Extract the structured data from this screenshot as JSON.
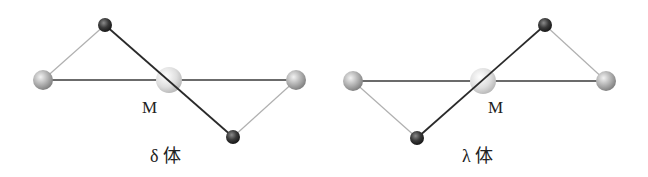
{
  "figure": {
    "panels": [
      {
        "id": "delta",
        "isomer_label": "δ 体",
        "metal_label": "M",
        "atoms": {
          "left": "ligand-donor",
          "top": "chelate-backbone",
          "center": "metal",
          "right": "ligand-donor",
          "bottom": "chelate-backbone"
        },
        "twist": "backbone goes top-left to bottom-right"
      },
      {
        "id": "lambda",
        "isomer_label": "λ 体",
        "metal_label": "M",
        "atoms": {
          "left": "ligand-donor",
          "bottom": "chelate-backbone",
          "center": "metal",
          "top": "chelate-backbone",
          "right": "ligand-donor"
        },
        "twist": "backbone goes bottom-left to top-right"
      }
    ],
    "colors": {
      "metal": "#d8d8d8",
      "donor": "#a8a8a8",
      "backbone": "#333333",
      "bond_dark": "#333333",
      "bond_light": "#a0a0a0"
    }
  }
}
